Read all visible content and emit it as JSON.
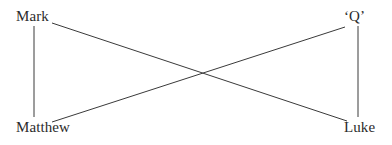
{
  "diagram": {
    "type": "synoptic-relationship-diagram",
    "background_color": "#ffffff",
    "line_color": "#3a3a3a",
    "text_color": "#2b2b2b",
    "nodes": [
      {
        "id": "mark",
        "label": "Mark",
        "position": "top-left"
      },
      {
        "id": "q",
        "label": "‘Q’",
        "position": "top-right"
      },
      {
        "id": "matthew",
        "label": "Matthew",
        "position": "bottom-left"
      },
      {
        "id": "luke",
        "label": "Luke",
        "position": "bottom-right"
      }
    ],
    "edges": [
      {
        "id": "mark-matthew",
        "from": "mark",
        "to": "matthew",
        "shape": "vertical"
      },
      {
        "id": "q-luke",
        "from": "q",
        "to": "luke",
        "shape": "vertical"
      },
      {
        "id": "mark-luke",
        "from": "mark",
        "to": "luke",
        "shape": "diagonal"
      },
      {
        "id": "matthew-q",
        "from": "matthew",
        "to": "q",
        "shape": "diagonal"
      }
    ]
  }
}
